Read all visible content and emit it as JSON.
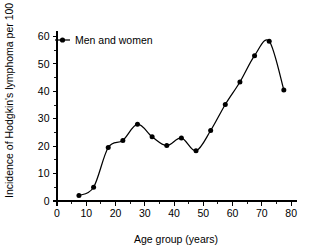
{
  "chart_data": {
    "type": "line",
    "title": "",
    "subtitle": "",
    "xlabel": "Age group (years)",
    "ylabel": "Incidence of Hodgkin's lymphoma per 100 000",
    "xlim": [
      0,
      82
    ],
    "ylim": [
      0,
      62
    ],
    "xticks": [
      0,
      10,
      20,
      30,
      40,
      50,
      60,
      70,
      80
    ],
    "xticklabels": [
      "0",
      "10",
      "20",
      "30",
      "40",
      "50",
      "60",
      "70",
      "80"
    ],
    "xminor_step": 5,
    "yticks": [
      0,
      10,
      20,
      30,
      40,
      50,
      60
    ],
    "yticklabels": [
      "0",
      "10",
      "20",
      "30",
      "40",
      "50",
      "60"
    ],
    "yminor_step": 5,
    "grid": false,
    "legend_position": "top-left",
    "legend": [
      "Men and women"
    ],
    "marker": "filled-circle",
    "line_color": "#000000",
    "marker_color": "#000000",
    "series": [
      {
        "name": "Men and women",
        "x": [
          7.5,
          12.5,
          17.5,
          22.5,
          27.5,
          32.5,
          37.5,
          42.5,
          47.5,
          52.5,
          57.5,
          62.5,
          67.5,
          72.5,
          77.5
        ],
        "values": [
          2.0,
          5.0,
          19.5,
          22.1,
          28.0,
          23.4,
          20.2,
          23.0,
          18.3,
          25.7,
          35.2,
          43.4,
          53.0,
          58.3,
          40.5
        ]
      }
    ]
  },
  "figure": {
    "background_color": "#ffffff",
    "axis_color": "#000000"
  }
}
